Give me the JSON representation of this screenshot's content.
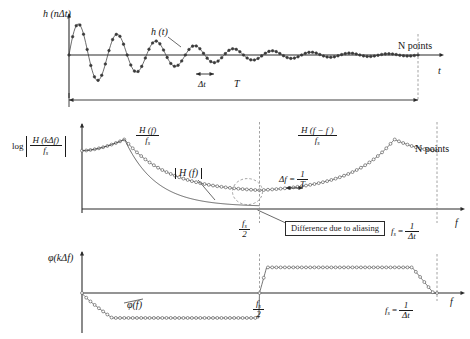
{
  "figure": {
    "ink_color": "#2b2b2b",
    "marker_color": "#3a3a3a",
    "dashed_color": "#8a8a8a"
  },
  "panels": {
    "time": {
      "name": "time-domain-panel",
      "y_axis_label": "h (nΔt)",
      "curve_label": "h (t)",
      "x_axis_label": "t",
      "n_points_label": "N points",
      "delta_label": "Δt",
      "span_label": "T"
    },
    "magnitude": {
      "name": "magnitude-spectrum-panel",
      "y_axis_label_prefix": "log",
      "y_axis_num": "H (kΔf)",
      "y_axis_den": "f",
      "y_axis_den_sub": "s",
      "left_alias_num": "H  (f)",
      "left_alias_num_sub": "s",
      "left_alias_den": "f",
      "left_alias_den_sub": "s",
      "right_alias_num": "H  (f − f )",
      "right_alias_den": "f",
      "true_spectrum_label": "H (f)",
      "delta_f_label": "Δf =",
      "delta_f_num": "1",
      "delta_f_den": "T",
      "nyquist_num": "f",
      "nyquist_num_sub": "s",
      "nyquist_den": "2",
      "fs_label": "f",
      "fs_label_sub": "s",
      "fs_equals": "=",
      "fs_num": "1",
      "fs_den": "Δt",
      "x_axis_label": "f",
      "n_points_label": "N points",
      "aliasing_note": "Difference due to aliasing"
    },
    "phase": {
      "name": "phase-spectrum-panel",
      "y_axis_label": "φ(kΔf)",
      "curve_label": "φ(f)",
      "x_axis_label": "f",
      "nyquist_num": "f",
      "nyquist_num_sub": "s",
      "nyquist_den": "2",
      "fs_label": "f",
      "fs_label_sub": "s",
      "fs_equals": "=",
      "fs_num": "1",
      "fs_den": "Δt"
    }
  },
  "chart_data": [
    {
      "type": "line",
      "name": "impulse-response",
      "title": "h (nΔt) damped sinusoid",
      "xlabel": "t",
      "ylabel": "h (nΔt)",
      "xlim": [
        0,
        1
      ],
      "ylim": [
        -1,
        1
      ],
      "grid": false,
      "model": {
        "kind": "damped_sine",
        "amplitude": 0.95,
        "decay": 3.6,
        "cycles": 9.0,
        "phase": 0
      },
      "n_samples": 96,
      "markers": "filled-circle"
    },
    {
      "type": "line",
      "name": "magnitude-spectrum",
      "title": "log |H (kΔf) / f_s|",
      "xlabel": "f",
      "ylabel": "log |H (kΔf)/f_s|",
      "xlim": [
        0,
        1
      ],
      "ylim": [
        0,
        1
      ],
      "grid": false,
      "model": {
        "kind": "resonance_plus_mirror",
        "peak_x": 0.12,
        "peak_y": 0.86,
        "base_y": 0.72,
        "valley_y": 0.2,
        "mirror_axis": 0.5
      },
      "true_curve": {
        "kind": "monotonic_decay",
        "start_y": 0.72,
        "end_y": 0.03,
        "end_x": 0.5
      },
      "n_samples": 84,
      "markers": "open-circle"
    },
    {
      "type": "line",
      "name": "phase-spectrum",
      "title": "φ(kΔf)",
      "xlabel": "f",
      "ylabel": "φ(kΔf)",
      "xlim": [
        0,
        1
      ],
      "ylim": [
        -1,
        1
      ],
      "grid": false,
      "model": {
        "kind": "phase_step",
        "low_level": -0.78,
        "high_level": 0.8,
        "step_x": 0.5,
        "rolloff_x": 0.93
      },
      "n_samples": 84,
      "markers": "open-circle"
    }
  ]
}
